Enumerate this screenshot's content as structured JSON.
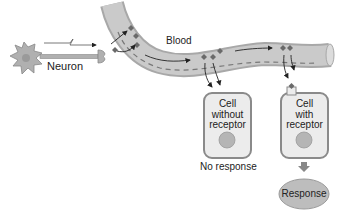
{
  "diagram": {
    "labels": {
      "neuron": "Neuron",
      "blood": "Blood",
      "cell_without": [
        "Cell",
        "without",
        "receptor"
      ],
      "cell_with": [
        "Cell",
        "with",
        "receptor"
      ],
      "no_response": "No response",
      "response": "Response"
    },
    "colors": {
      "vessel_fill": "#c9c9c9",
      "vessel_edge": "#a8a8a8",
      "cell_fill": "#ececec",
      "cell_border": "#8a8a8a",
      "nucleus": "#b5b5b5",
      "hormone": "#6a6a6a",
      "response_fill": "#bdbdbd",
      "neuron_fill": "#b0b0b0"
    }
  }
}
